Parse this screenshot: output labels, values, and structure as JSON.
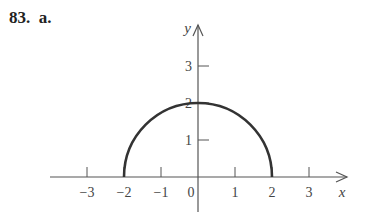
{
  "problem": {
    "number": "83.",
    "part": "a."
  },
  "chart_data": {
    "type": "line",
    "title": "",
    "xlabel": "x",
    "ylabel": "y",
    "xlim": [
      -4,
      4
    ],
    "ylim": [
      -1,
      4
    ],
    "x_ticks": [
      -3,
      -2,
      -1,
      1,
      2,
      3
    ],
    "x_tick_labels": [
      "−3",
      "−2",
      "−1",
      "1",
      "2",
      "3"
    ],
    "y_ticks": [
      1,
      2,
      3
    ],
    "y_tick_labels": [
      "1",
      "2",
      "3"
    ],
    "origin_label": "0",
    "grid": false,
    "legend": null,
    "series": [
      {
        "name": "semicircle",
        "x": [
          -2,
          -1.5,
          -1,
          -0.5,
          0,
          0.5,
          1,
          1.5,
          2
        ],
        "y": [
          0,
          1.32,
          1.73,
          1.94,
          2,
          1.94,
          1.73,
          1.32,
          0
        ]
      }
    ]
  },
  "plot": {
    "origin_px": [
      198,
      177
    ],
    "unit_px": 37,
    "x_axis_start_px": 50,
    "x_axis_end_px": 347,
    "y_axis_top_px": 25,
    "y_axis_bottom_px": 212,
    "stroke_color": "#555555",
    "curve_color": "#333333"
  }
}
